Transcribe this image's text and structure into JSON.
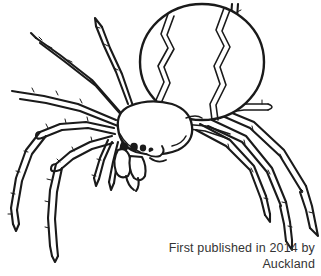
{
  "image": {
    "subject": "spider",
    "style": "black and white line art coloring page",
    "background_color": "#ffffff",
    "line_color": "#1a1a1a",
    "width": 321,
    "height": 276
  },
  "artwork": {
    "title": "spider-line-drawing",
    "parts": {
      "abdomen": "large oval abdomen with zigzag stripe markings",
      "cephalothorax": "head and thorax segment",
      "eyes_count": 4,
      "legs_count": 8,
      "chelicerae": "fangs below head",
      "pedipalps": "short front appendages"
    }
  },
  "credit": {
    "line1": "First published in 2014 by",
    "line2": "Auckland",
    "color": "#333333"
  }
}
